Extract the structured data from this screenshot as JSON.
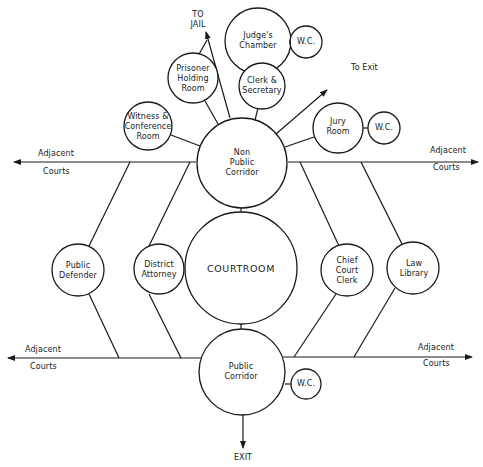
{
  "diagram": {
    "caption_partial": "... ... ... ... ...",
    "nodes": {
      "non_public_corridor": "Non\nPublic\nCorridor",
      "courtroom": "COURTROOM",
      "public_corridor": "Public\nCorridor",
      "public_defender": "Public\nDefender",
      "district_attorney": "District\nAttorney",
      "chief_court_clerk": "Chief\nCourt\nClerk",
      "law_library": "Law\nLibrary",
      "witness_conference_room": "Witness &\nConference\nRoom",
      "prisoner_holding_room": "Prisoner\nHolding\nRoom",
      "judges_chamber": "Judge's\nChamber",
      "wc_judge": "W.C.",
      "clerk_secretary": "Clerk &\nSecretary",
      "jury_room": "Jury\nRoom",
      "wc_jury": "W.C.",
      "wc_public": "W.C."
    },
    "labels": {
      "to_jail": "TO\nJAIL",
      "to_exit": "To Exit",
      "exit": "EXIT",
      "adjacent_top_left": "Adjacent",
      "courts_top_left": "Courts",
      "adjacent_top_right": "Adjacent",
      "courts_top_right": "Courts",
      "adjacent_bottom_left": "Adjacent",
      "courts_bottom_left": "Courts",
      "adjacent_bottom_right": "Adjacent",
      "courts_bottom_right": "Courts"
    },
    "edges": [
      [
        "non_public_corridor",
        "courtroom"
      ],
      [
        "courtroom",
        "public_corridor"
      ],
      [
        "non_public_corridor",
        "witness_conference_room"
      ],
      [
        "non_public_corridor",
        "prisoner_holding_room"
      ],
      [
        "non_public_corridor",
        "clerk_secretary"
      ],
      [
        "non_public_corridor",
        "jury_room"
      ],
      [
        "non_public_corridor",
        "to_exit"
      ],
      [
        "non_public_corridor",
        "to_jail"
      ],
      [
        "prisoner_holding_room",
        "to_jail"
      ],
      [
        "clerk_secretary",
        "judges_chamber"
      ],
      [
        "judges_chamber",
        "wc_judge"
      ],
      [
        "jury_room",
        "wc_jury"
      ],
      [
        "public_corridor",
        "wc_public"
      ],
      [
        "public_corridor",
        "exit"
      ],
      [
        "public_defender",
        "non_public_corridor_line"
      ],
      [
        "public_defender",
        "public_corridor_line"
      ],
      [
        "district_attorney",
        "non_public_corridor_line"
      ],
      [
        "district_attorney",
        "public_corridor_line"
      ],
      [
        "chief_court_clerk",
        "non_public_corridor_line"
      ],
      [
        "chief_court_clerk",
        "public_corridor_line"
      ],
      [
        "law_library",
        "non_public_corridor_line"
      ],
      [
        "law_library",
        "public_corridor_line"
      ]
    ]
  }
}
